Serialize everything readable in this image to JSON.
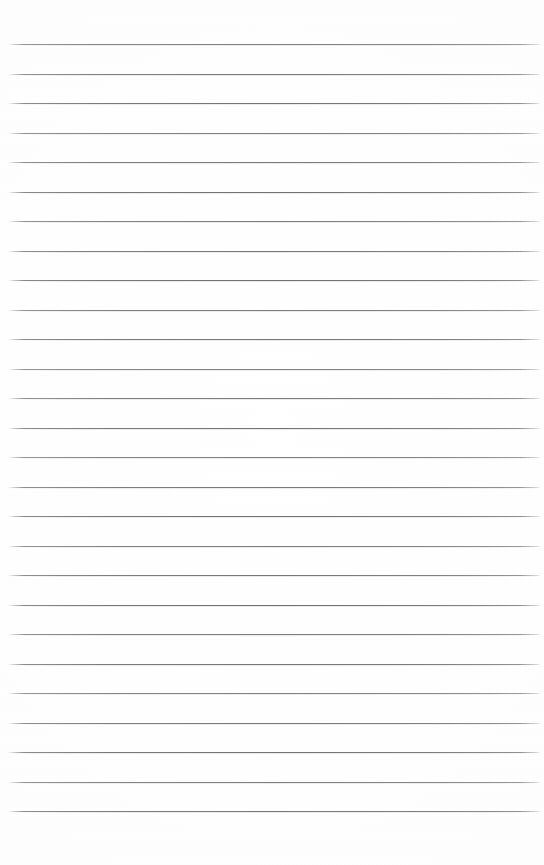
{
  "document": {
    "kind": "scanned-lined-paper",
    "description": "Blank scanned sheet of ruled notebook paper",
    "written_content": "",
    "page_width": 544,
    "page_height": 865,
    "background_color": "#fdfdfd",
    "paper_color": "#ffffff"
  },
  "ruling": {
    "line_color": "#8a8a8a",
    "line_thickness": 1,
    "line_count": 27,
    "first_line_y": 44,
    "line_spacing": 29.5,
    "last_line_y": 811,
    "line_start_x": 8,
    "line_end_x": 541,
    "top_margin": 44,
    "bottom_margin": 54,
    "has_vertical_margin_rule": false,
    "has_header": false,
    "has_page_number": false,
    "lines_y": [
      44,
      73.5,
      103,
      132.5,
      162,
      191.5,
      221,
      250.5,
      280,
      309.5,
      339,
      368.5,
      398,
      427.5,
      457,
      486.5,
      516,
      545.5,
      575,
      604.5,
      634,
      663.5,
      693,
      722.5,
      752,
      781.5,
      811
    ]
  }
}
